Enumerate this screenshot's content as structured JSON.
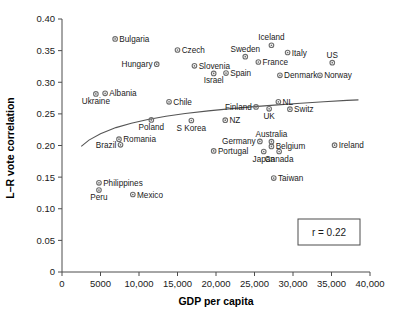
{
  "chart_data": {
    "type": "scatter",
    "title": "",
    "xlabel": "GDP per capita",
    "ylabel": "L–R vote correlation",
    "xlim": [
      0,
      40000
    ],
    "ylim": [
      0,
      0.4
    ],
    "xticks": [
      "0",
      "5000",
      "10,000",
      "15,000",
      "20,000",
      "25,000",
      "30,000",
      "35,000",
      "40,000"
    ],
    "xtick_values": [
      0,
      5000,
      10000,
      15000,
      20000,
      25000,
      30000,
      35000,
      40000
    ],
    "yticks": [
      "0",
      "0.05",
      "0.10",
      "0.15",
      "0.20",
      "0.25",
      "0.30",
      "0.35",
      "0.40"
    ],
    "ytick_values": [
      0,
      0.05,
      0.1,
      0.15,
      0.2,
      0.25,
      0.3,
      0.35,
      0.4
    ],
    "grid": false,
    "legend": "none",
    "annotation": "r = 0.22",
    "trendline": {
      "type": "logarithmic",
      "points": [
        [
          2500,
          0.1985
        ],
        [
          3500,
          0.2085
        ],
        [
          5000,
          0.2185
        ],
        [
          7000,
          0.2283
        ],
        [
          9000,
          0.2353
        ],
        [
          11000,
          0.2408
        ],
        [
          13500,
          0.2462
        ],
        [
          16000,
          0.2505
        ],
        [
          19000,
          0.2548
        ],
        [
          22000,
          0.2583
        ],
        [
          25000,
          0.2615
        ],
        [
          28000,
          0.2643
        ],
        [
          31000,
          0.2668
        ],
        [
          34000,
          0.2692
        ],
        [
          37000,
          0.2713
        ],
        [
          38500,
          0.2722
        ]
      ]
    },
    "points": [
      {
        "name": "Bulgaria",
        "x": 6900,
        "y": 0.3685,
        "label_pos": "right"
      },
      {
        "name": "Czech",
        "x": 15000,
        "y": 0.351,
        "label_pos": "right"
      },
      {
        "name": "Sweden",
        "x": 23800,
        "y": 0.3405,
        "label_pos": "above"
      },
      {
        "name": "Iceland",
        "x": 27200,
        "y": 0.3585,
        "label_pos": "above"
      },
      {
        "name": "Italy",
        "x": 29300,
        "y": 0.347,
        "label_pos": "right"
      },
      {
        "name": "US",
        "x": 35100,
        "y": 0.331,
        "label_pos": "above"
      },
      {
        "name": "Hungary",
        "x": 12300,
        "y": 0.3285,
        "label_pos": "left"
      },
      {
        "name": "Slovenia",
        "x": 17200,
        "y": 0.326,
        "label_pos": "right"
      },
      {
        "name": "France",
        "x": 25500,
        "y": 0.332,
        "label_pos": "right"
      },
      {
        "name": "Spain",
        "x": 21300,
        "y": 0.3145,
        "label_pos": "right"
      },
      {
        "name": "Israel",
        "x": 19700,
        "y": 0.314,
        "label_pos": "below"
      },
      {
        "name": "Denmark",
        "x": 28300,
        "y": 0.311,
        "label_pos": "right"
      },
      {
        "name": "Norway",
        "x": 33500,
        "y": 0.311,
        "label_pos": "right"
      },
      {
        "name": "Ukraine",
        "x": 4400,
        "y": 0.2815,
        "label_pos": "below"
      },
      {
        "name": "Albania",
        "x": 5600,
        "y": 0.2825,
        "label_pos": "right"
      },
      {
        "name": "Chile",
        "x": 13900,
        "y": 0.269,
        "label_pos": "right"
      },
      {
        "name": "Finland",
        "x": 25200,
        "y": 0.261,
        "label_pos": "left"
      },
      {
        "name": "NL",
        "x": 28100,
        "y": 0.269,
        "label_pos": "right"
      },
      {
        "name": "UK",
        "x": 26900,
        "y": 0.258,
        "label_pos": "below"
      },
      {
        "name": "Switz",
        "x": 29600,
        "y": 0.2575,
        "label_pos": "right"
      },
      {
        "name": "Poland",
        "x": 11600,
        "y": 0.2405,
        "label_pos": "below"
      },
      {
        "name": "S Korea",
        "x": 16800,
        "y": 0.2395,
        "label_pos": "below"
      },
      {
        "name": "NZ",
        "x": 21200,
        "y": 0.24,
        "label_pos": "right"
      },
      {
        "name": "Romania",
        "x": 7400,
        "y": 0.21,
        "label_pos": "right"
      },
      {
        "name": "Brazil",
        "x": 7600,
        "y": 0.201,
        "label_pos": "left"
      },
      {
        "name": "Germany",
        "x": 25700,
        "y": 0.2065,
        "label_pos": "left"
      },
      {
        "name": "Australia",
        "x": 27200,
        "y": 0.206,
        "label_pos": "above"
      },
      {
        "name": "Belgium",
        "x": 27200,
        "y": 0.1985,
        "label_pos": "right"
      },
      {
        "name": "Ireland",
        "x": 35400,
        "y": 0.2005,
        "label_pos": "right"
      },
      {
        "name": "Portugal",
        "x": 19700,
        "y": 0.1915,
        "label_pos": "right"
      },
      {
        "name": "Japan",
        "x": 26200,
        "y": 0.1905,
        "label_pos": "below"
      },
      {
        "name": "Canada",
        "x": 28200,
        "y": 0.1905,
        "label_pos": "below"
      },
      {
        "name": "Taiwan",
        "x": 27500,
        "y": 0.1485,
        "label_pos": "right"
      },
      {
        "name": "Philippines",
        "x": 4800,
        "y": 0.141,
        "label_pos": "right"
      },
      {
        "name": "Peru",
        "x": 4800,
        "y": 0.1295,
        "label_pos": "below"
      },
      {
        "name": "Mexico",
        "x": 9200,
        "y": 0.1225,
        "label_pos": "right"
      }
    ]
  }
}
